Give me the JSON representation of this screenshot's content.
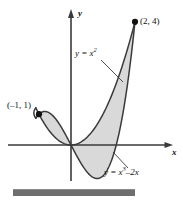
{
  "figure": {
    "background_color": "#ffffff",
    "shade_color": "#d9d9d9",
    "curve_color": "#3a3a3a",
    "axis_color": "#3a3a3a",
    "bar_color": "#6e6e6e"
  },
  "axes": {
    "x_label": "x",
    "y_label": "y",
    "origin_px": [
      71,
      145
    ],
    "x_axis_start_px": [
      8,
      145
    ],
    "x_axis_end_px": [
      172,
      145
    ],
    "y_axis_top_px": [
      71,
      10
    ],
    "y_axis_bottom_px": [
      71,
      181
    ],
    "units_per_px_x": 32,
    "units_per_px_y": 30.8
  },
  "labels": {
    "point_top": "(2, 4)",
    "point_left": "(–1, 1)",
    "curve_parabola_prefix": "y = x",
    "curve_parabola_exponent": "2",
    "curve_cubic_prefix": "y = x",
    "curve_cubic_exponent": "3",
    "curve_cubic_suffix": "–2x"
  },
  "points": [
    {
      "name": "intersection-left",
      "label": "(–1, 1)",
      "x": -1,
      "y": 1,
      "px": [
        45,
        105
      ]
    },
    {
      "name": "intersection-right",
      "label": "(2, 4)",
      "x": 2,
      "y": 4,
      "px": [
        135,
        22
      ]
    }
  ],
  "chart_data": {
    "type": "line",
    "title": "",
    "xlabel": "x",
    "ylabel": "y",
    "xlim": [
      -2.0,
      3.2
    ],
    "ylim": [
      -1.3,
      4.4
    ],
    "grid": false,
    "legend": "annotations",
    "shaded_region": {
      "between": [
        "y = x²",
        "y = x³ –2x"
      ],
      "x_from": -1,
      "x_to": 2,
      "fill": "#d9d9d9"
    },
    "annotations": [
      {
        "text": "(2, 4)",
        "x": 2,
        "y": 4
      },
      {
        "text": "(–1, 1)",
        "x": -1,
        "y": 1
      },
      {
        "text": "y = x²",
        "x": -0.15,
        "y": 3.05
      },
      {
        "text": "y = x³ –2x",
        "x": 1.35,
        "y": -0.85
      }
    ],
    "series": [
      {
        "name": "y = x²",
        "expression": "y = x^2",
        "x": [
          -1.0,
          -0.75,
          -0.5,
          -0.25,
          0.0,
          0.25,
          0.5,
          0.75,
          1.0,
          1.25,
          1.5,
          1.75,
          2.0
        ],
        "values": [
          1.0,
          0.5625,
          0.25,
          0.0625,
          0.0,
          0.0625,
          0.25,
          0.5625,
          1.0,
          1.5625,
          2.25,
          3.0625,
          4.0
        ]
      },
      {
        "name": "y = x³ –2x",
        "expression": "y = x^3 - 2x",
        "x": [
          -1.0,
          -0.75,
          -0.5,
          -0.25,
          0.0,
          0.25,
          0.5,
          0.75,
          1.0,
          1.25,
          1.5,
          1.75,
          2.0
        ],
        "values": [
          1.0,
          1.078125,
          0.875,
          0.484375,
          0.0,
          -0.484375,
          -0.875,
          -1.078125,
          -1.0,
          -0.546875,
          0.375,
          1.859375,
          4.0
        ]
      }
    ]
  }
}
